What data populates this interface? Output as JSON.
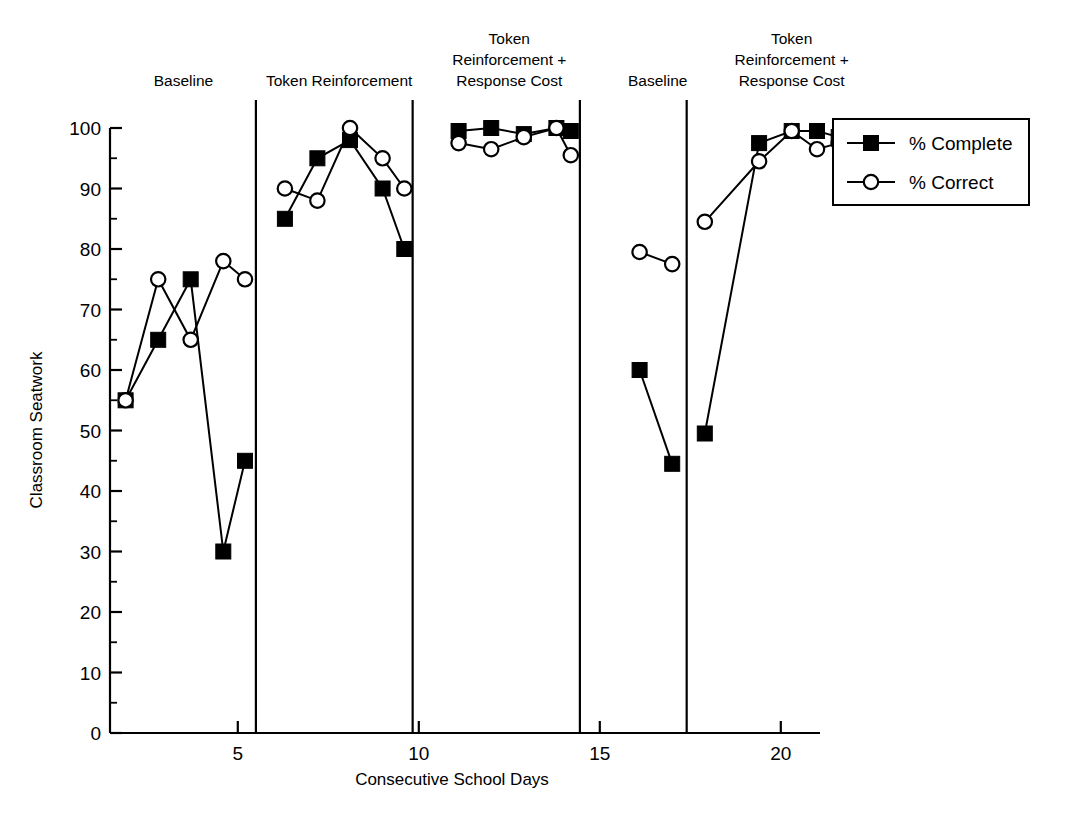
{
  "chart_data": {
    "type": "line",
    "title": "",
    "xlabel": "Consecutive School Days",
    "ylabel": "Classroom Seatwork",
    "xlim": [
      0.5,
      22.2
    ],
    "ylim": [
      0,
      100
    ],
    "xticks": [
      5,
      10,
      15,
      20
    ],
    "yticks": [
      0,
      10,
      20,
      30,
      40,
      50,
      60,
      70,
      80,
      90,
      100
    ],
    "y_minor_step": 5,
    "grid": false,
    "legend_position": "right",
    "series": [
      {
        "name": "% Complete",
        "marker": "filled-square",
        "points": [
          {
            "x": 1.9,
            "y": 55
          },
          {
            "x": 2.8,
            "y": 65
          },
          {
            "x": 3.7,
            "y": 75
          },
          {
            "x": 4.6,
            "y": 30
          },
          {
            "x": 5.2,
            "y": 45
          },
          {
            "x": 6.3,
            "y": 85
          },
          {
            "x": 7.2,
            "y": 95
          },
          {
            "x": 8.1,
            "y": 98
          },
          {
            "x": 9.0,
            "y": 90
          },
          {
            "x": 9.6,
            "y": 80
          },
          {
            "x": 11.1,
            "y": 99.5
          },
          {
            "x": 12.0,
            "y": 100
          },
          {
            "x": 12.9,
            "y": 99
          },
          {
            "x": 13.8,
            "y": 100
          },
          {
            "x": 14.2,
            "y": 99.5
          },
          {
            "x": 16.1,
            "y": 60
          },
          {
            "x": 17.0,
            "y": 44.5
          },
          {
            "x": 17.9,
            "y": 49.5
          },
          {
            "x": 19.4,
            "y": 97.5
          },
          {
            "x": 20.3,
            "y": 99.5
          },
          {
            "x": 21.0,
            "y": 99.5
          },
          {
            "x": 21.6,
            "y": 98.5
          }
        ]
      },
      {
        "name": "% Correct",
        "marker": "open-circle",
        "points": [
          {
            "x": 1.9,
            "y": 55
          },
          {
            "x": 2.8,
            "y": 75
          },
          {
            "x": 3.7,
            "y": 65
          },
          {
            "x": 4.6,
            "y": 78
          },
          {
            "x": 5.2,
            "y": 75
          },
          {
            "x": 6.3,
            "y": 90
          },
          {
            "x": 7.2,
            "y": 88
          },
          {
            "x": 8.1,
            "y": 100
          },
          {
            "x": 9.0,
            "y": 95
          },
          {
            "x": 9.6,
            "y": 90
          },
          {
            "x": 11.1,
            "y": 97.5
          },
          {
            "x": 12.0,
            "y": 96.5
          },
          {
            "x": 12.9,
            "y": 98.5
          },
          {
            "x": 13.8,
            "y": 100
          },
          {
            "x": 14.2,
            "y": 95.5
          },
          {
            "x": 16.1,
            "y": 79.5
          },
          {
            "x": 17.0,
            "y": 77.5
          },
          {
            "x": 17.9,
            "y": 84.5
          },
          {
            "x": 19.4,
            "y": 94.5
          },
          {
            "x": 20.3,
            "y": 99.5
          },
          {
            "x": 21.0,
            "y": 96.5
          },
          {
            "x": 21.6,
            "y": 97.5
          }
        ]
      }
    ],
    "phases": [
      {
        "label": "Baseline",
        "lines": [
          "Baseline"
        ],
        "center_x": 3.5,
        "divider_after": 5.5
      },
      {
        "label": "Token Reinforcement",
        "lines": [
          "Token Reinforcement"
        ],
        "center_x": 7.8,
        "divider_after": 9.83
      },
      {
        "label": "Token Reinforcement + Response Cost",
        "lines": [
          "Token",
          "Reinforcement +",
          "Response Cost"
        ],
        "center_x": 12.5,
        "divider_after": 14.45
      },
      {
        "label": "Baseline",
        "lines": [
          "Baseline"
        ],
        "center_x": 16.6,
        "divider_after": 17.4
      },
      {
        "label": "Token Reinforcement + Response Cost",
        "lines": [
          "Token",
          "Reinforcement +",
          "Response Cost"
        ],
        "center_x": 20.3,
        "divider_after": null
      }
    ],
    "legend": [
      {
        "label": "% Complete",
        "marker": "filled-square"
      },
      {
        "label": "% Correct",
        "marker": "open-circle"
      }
    ],
    "colors": {
      "line": "#000000",
      "marker_fill": "#000000",
      "marker_open_fill": "#ffffff",
      "axis": "#000000",
      "background": "#ffffff"
    }
  },
  "axis": {
    "y_title": "Classroom Seatwork",
    "x_title": "Consecutive School Days"
  }
}
